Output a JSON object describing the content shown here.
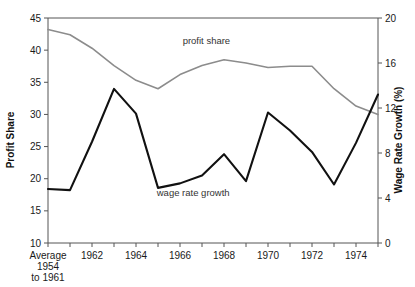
{
  "chart_data": {
    "type": "line",
    "title": "",
    "xlabel": "",
    "ylabel": "Profit Share",
    "y2label": "Wage Rate Growth (%)",
    "grid": false,
    "legend_position": "inline-annotations",
    "categories": [
      "Average 1954 to 1961",
      "1961",
      "1962",
      "1963",
      "1964",
      "1965",
      "1966",
      "1967",
      "1968",
      "1969",
      "1970",
      "1971",
      "1972",
      "1973",
      "1974",
      "1975"
    ],
    "x_tick_labels": [
      {
        "index": 0,
        "lines": [
          "Average",
          "1954",
          "to 1961"
        ]
      },
      {
        "index": 2,
        "lines": [
          "1962"
        ]
      },
      {
        "index": 4,
        "lines": [
          "1964"
        ]
      },
      {
        "index": 6,
        "lines": [
          "1966"
        ]
      },
      {
        "index": 8,
        "lines": [
          "1968"
        ]
      },
      {
        "index": 10,
        "lines": [
          "1970"
        ]
      },
      {
        "index": 12,
        "lines": [
          "1972"
        ]
      },
      {
        "index": 14,
        "lines": [
          "1974"
        ]
      }
    ],
    "ylim": [
      10,
      45
    ],
    "yticks": [
      10,
      15,
      20,
      25,
      30,
      35,
      40,
      45
    ],
    "y2lim": [
      0,
      20
    ],
    "y2ticks": [
      0,
      4,
      8,
      12,
      16,
      20
    ],
    "series": [
      {
        "name": "profit share",
        "axis": "left",
        "color": "#8c8c8c",
        "linewidth": 1.6,
        "annotation": "profit share",
        "values": [
          43.2,
          42.4,
          40.3,
          37.6,
          35.3,
          34.0,
          36.2,
          37.6,
          38.5,
          38.0,
          37.3,
          37.5,
          37.5,
          34.0,
          31.3,
          30.0
        ]
      },
      {
        "name": "wage rate growth",
        "axis": "right",
        "color": "#111111",
        "linewidth": 2.1,
        "annotation": "wage rate growth",
        "values": [
          4.8,
          4.7,
          9.0,
          13.7,
          11.5,
          4.9,
          5.3,
          6.0,
          7.9,
          5.5,
          11.6,
          10.0,
          8.1,
          5.2,
          8.9,
          13.2
        ]
      }
    ],
    "annotations": [
      {
        "text": "profit share",
        "x_index": 7.2,
        "y_value": 41.0,
        "axis": "left"
      },
      {
        "text": "wage rate growth",
        "x_index": 6.6,
        "y_value": 4.15,
        "axis": "right"
      }
    ]
  },
  "axes": {
    "left_title": "Profit Share",
    "right_title": "Wage Rate Growth (%)"
  }
}
